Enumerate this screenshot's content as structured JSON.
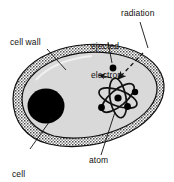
{
  "figure": {
    "width": 174,
    "height": 182,
    "background_color": "#ffffff",
    "line_color": "#111111"
  },
  "labels": {
    "radiation": "radiation",
    "ejected_electron": "ejected\nelectron",
    "ejected_electron_line1": "ejected",
    "ejected_electron_line2": "electron",
    "cell_wall": "cell wall",
    "cell_nucleus": "cell\nnucleus",
    "cell_nucleus_line1": "cell",
    "cell_nucleus_line2": "nucleus",
    "atom": "atom"
  },
  "parts": {
    "cell_body_fill": "#d9d9d9",
    "cell_wall_fill": "#b5b5b5",
    "cell_nucleus_fill": "#000000",
    "electron_fill": "#000000",
    "atom_orbit_color": "#000000",
    "radiation_arrow_style": "dashed",
    "electron_arrow_style": "solid"
  },
  "annotations": {
    "leader_lines": [
      "cell-wall-leader",
      "cell-nucleus-leader",
      "atom-leader",
      "radiation-leader",
      "ejected-electron-leader"
    ]
  }
}
